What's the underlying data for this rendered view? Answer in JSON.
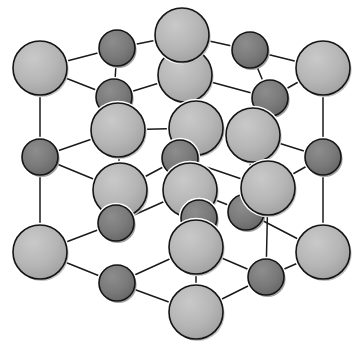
{
  "figure": {
    "background_color": "#ffffff",
    "width": 362,
    "height": 347
  },
  "style": {
    "large_sphere_fill": "#b4b4b4",
    "large_sphere_edge": "#141414",
    "large_sphere_highlight": "#c8c8c8",
    "large_sphere_shadow": "#8e8e8e",
    "small_sphere_fill": "#787878",
    "small_sphere_edge": "#141414",
    "small_sphere_highlight": "#8c8c8c",
    "small_sphere_shadow": "#555555",
    "bond_color": "#1a1a1a",
    "bond_width": 1.5,
    "large_radius": 27,
    "small_radius": 18
  },
  "chart_data": {
    "type": "scatter",
    "xlabel": "",
    "ylabel": "",
    "xlim": [
      0,
      362
    ],
    "ylim": [
      0,
      347
    ],
    "grid": false,
    "legend": null,
    "projection": "oblique",
    "lattice": {
      "type": "rock-salt",
      "grid_size": 3,
      "origin_screen": [
        40,
        252
      ],
      "axis_a_screen": [
        78,
        0
      ],
      "axis_b_screen": [
        0,
        -92
      ],
      "axis_c_screen": [
        52,
        -37
      ],
      "site_parity_rule": "sum of (i+j+k) even = large light sphere, odd = small dark sphere"
    },
    "series": [
      {
        "name": "large-anion",
        "label": "Large light-grey sphere (anion)",
        "color": "#b4b4b4",
        "radius": 27,
        "count": 14,
        "points": [
          {
            "id": "A01",
            "cx": 40,
            "cy": 68,
            "ijk": [
              0,
              2,
              0
            ],
            "z": 1
          },
          {
            "id": "A02",
            "cx": 182,
            "cy": 35,
            "ijk": [
              1,
              2,
              1
            ],
            "z": 3
          },
          {
            "id": "A03",
            "cx": 323,
            "cy": 68,
            "ijk": [
              2,
              2,
              0
            ],
            "z": 1
          },
          {
            "id": "A04",
            "cx": 185,
            "cy": 75,
            "ijk": [
              1,
              2,
              0
            ],
            "z": 2
          },
          {
            "id": "A05",
            "cx": 118,
            "cy": 130,
            "ijk": [
              1,
              1,
              2
            ],
            "z": 5
          },
          {
            "id": "A06",
            "cx": 196,
            "cy": 128,
            "ijk": [
              2,
              2,
              1
            ],
            "z": 6
          },
          {
            "id": "A07",
            "cx": 253,
            "cy": 135,
            "ijk": [
              2,
              1,
              1
            ],
            "z": 4
          },
          {
            "id": "A08",
            "cx": 120,
            "cy": 190,
            "ijk": [
              1,
              1,
              0
            ],
            "z": 7
          },
          {
            "id": "A09",
            "cx": 190,
            "cy": 190,
            "ijk": [
              2,
              1,
              0
            ],
            "z": 8
          },
          {
            "id": "A10",
            "cx": 268,
            "cy": 188,
            "ijk": [
              2,
              0,
              2
            ],
            "z": 9
          },
          {
            "id": "A11",
            "cx": 40,
            "cy": 252,
            "ijk": [
              0,
              0,
              0
            ],
            "z": 10
          },
          {
            "id": "A12",
            "cx": 196,
            "cy": 247,
            "ijk": [
              1,
              0,
              1
            ],
            "z": 11
          },
          {
            "id": "A13",
            "cx": 323,
            "cy": 252,
            "ijk": [
              2,
              0,
              0
            ],
            "z": 10
          },
          {
            "id": "A14",
            "cx": 196,
            "cy": 312,
            "ijk": [
              1,
              0,
              0
            ],
            "z": 12
          }
        ]
      },
      {
        "name": "small-cation",
        "label": "Small dark-grey sphere (cation)",
        "color": "#787878",
        "radius": 18,
        "count": 13,
        "points": [
          {
            "id": "B01",
            "cx": 117,
            "cy": 48,
            "ijk": [
              0,
              2,
              1
            ],
            "z": 2
          },
          {
            "id": "B02",
            "cx": 250,
            "cy": 50,
            "ijk": [
              2,
              2,
              1
            ],
            "z": 2
          },
          {
            "id": "B03",
            "cx": 114,
            "cy": 97,
            "ijk": [
              0,
              2,
              0
            ],
            "z": 3
          },
          {
            "id": "B04",
            "cx": 270,
            "cy": 98,
            "ijk": [
              2,
              2,
              0
            ],
            "z": 3
          },
          {
            "id": "B05",
            "cx": 40,
            "cy": 157,
            "ijk": [
              0,
              1,
              0
            ],
            "z": 4
          },
          {
            "id": "B06",
            "cx": 180,
            "cy": 158,
            "ijk": [
              1,
              1,
              1
            ],
            "z": 6
          },
          {
            "id": "B07",
            "cx": 323,
            "cy": 157,
            "ijk": [
              2,
              1,
              0
            ],
            "z": 4
          },
          {
            "id": "B08",
            "cx": 116,
            "cy": 223,
            "ijk": [
              1,
              0,
              2
            ],
            "z": 7
          },
          {
            "id": "B09",
            "cx": 199,
            "cy": 218,
            "ijk": [
              1,
              1,
              0
            ],
            "z": 9
          },
          {
            "id": "B10",
            "cx": 246,
            "cy": 212,
            "ijk": [
              2,
              1,
              0
            ],
            "z": 8
          },
          {
            "id": "B11",
            "cx": 117,
            "cy": 283,
            "ijk": [
              0,
              0,
              1
            ],
            "z": 11
          },
          {
            "id": "B12",
            "cx": 266,
            "cy": 277,
            "ijk": [
              2,
              0,
              1
            ],
            "z": 11
          },
          {
            "id": "B13",
            "cx": 199,
            "cy": 218,
            "ijk": [
              1,
              0,
              1
            ],
            "z": 9
          }
        ]
      }
    ],
    "bonds": [
      {
        "from": [
          40,
          68
        ],
        "to": [
          117,
          48
        ],
        "kind": "edge"
      },
      {
        "from": [
          117,
          48
        ],
        "to": [
          182,
          35
        ],
        "kind": "edge"
      },
      {
        "from": [
          182,
          35
        ],
        "to": [
          250,
          50
        ],
        "kind": "edge"
      },
      {
        "from": [
          250,
          50
        ],
        "to": [
          323,
          68
        ],
        "kind": "edge"
      },
      {
        "from": [
          40,
          68
        ],
        "to": [
          114,
          97
        ],
        "kind": "depth"
      },
      {
        "from": [
          114,
          97
        ],
        "to": [
          185,
          75
        ],
        "kind": "edge"
      },
      {
        "from": [
          185,
          75
        ],
        "to": [
          270,
          98
        ],
        "kind": "edge"
      },
      {
        "from": [
          270,
          98
        ],
        "to": [
          323,
          68
        ],
        "kind": "depth"
      },
      {
        "from": [
          117,
          48
        ],
        "to": [
          114,
          97
        ],
        "kind": "vertical"
      },
      {
        "from": [
          250,
          50
        ],
        "to": [
          270,
          98
        ],
        "kind": "vertical"
      },
      {
        "from": [
          182,
          35
        ],
        "to": [
          185,
          75
        ],
        "kind": "vertical"
      },
      {
        "from": [
          114,
          97
        ],
        "to": [
          118,
          130
        ],
        "kind": "vertical"
      },
      {
        "from": [
          270,
          98
        ],
        "to": [
          253,
          135
        ],
        "kind": "vertical"
      },
      {
        "from": [
          40,
          68
        ],
        "to": [
          40,
          157
        ],
        "kind": "vertical"
      },
      {
        "from": [
          323,
          68
        ],
        "to": [
          323,
          157
        ],
        "kind": "vertical"
      },
      {
        "from": [
          40,
          157
        ],
        "to": [
          118,
          130
        ],
        "kind": "edge"
      },
      {
        "from": [
          118,
          130
        ],
        "to": [
          196,
          128
        ],
        "kind": "edge"
      },
      {
        "from": [
          196,
          128
        ],
        "to": [
          253,
          135
        ],
        "kind": "edge"
      },
      {
        "from": [
          253,
          135
        ],
        "to": [
          323,
          157
        ],
        "kind": "edge"
      },
      {
        "from": [
          40,
          157
        ],
        "to": [
          120,
          190
        ],
        "kind": "depth"
      },
      {
        "from": [
          120,
          190
        ],
        "to": [
          180,
          158
        ],
        "kind": "edge"
      },
      {
        "from": [
          180,
          158
        ],
        "to": [
          268,
          188
        ],
        "kind": "edge"
      },
      {
        "from": [
          268,
          188
        ],
        "to": [
          323,
          157
        ],
        "kind": "depth"
      },
      {
        "from": [
          118,
          130
        ],
        "to": [
          120,
          190
        ],
        "kind": "vertical"
      },
      {
        "from": [
          196,
          128
        ],
        "to": [
          199,
          218
        ],
        "kind": "vertical"
      },
      {
        "from": [
          253,
          135
        ],
        "to": [
          246,
          212
        ],
        "kind": "vertical"
      },
      {
        "from": [
          120,
          190
        ],
        "to": [
          116,
          223
        ],
        "kind": "vertical"
      },
      {
        "from": [
          268,
          188
        ],
        "to": [
          266,
          277
        ],
        "kind": "vertical"
      },
      {
        "from": [
          40,
          157
        ],
        "to": [
          40,
          252
        ],
        "kind": "vertical"
      },
      {
        "from": [
          323,
          157
        ],
        "to": [
          323,
          252
        ],
        "kind": "vertical"
      },
      {
        "from": [
          40,
          252
        ],
        "to": [
          116,
          223
        ],
        "kind": "depth"
      },
      {
        "from": [
          116,
          223
        ],
        "to": [
          190,
          190
        ],
        "kind": "depth"
      },
      {
        "from": [
          190,
          190
        ],
        "to": [
          246,
          212
        ],
        "kind": "depth"
      },
      {
        "from": [
          246,
          212
        ],
        "to": [
          323,
          252
        ],
        "kind": "depth"
      },
      {
        "from": [
          40,
          252
        ],
        "to": [
          117,
          283
        ],
        "kind": "edge"
      },
      {
        "from": [
          117,
          283
        ],
        "to": [
          196,
          247
        ],
        "kind": "edge"
      },
      {
        "from": [
          196,
          247
        ],
        "to": [
          266,
          277
        ],
        "kind": "edge"
      },
      {
        "from": [
          266,
          277
        ],
        "to": [
          323,
          252
        ],
        "kind": "edge"
      },
      {
        "from": [
          117,
          283
        ],
        "to": [
          196,
          312
        ],
        "kind": "edge"
      },
      {
        "from": [
          196,
          312
        ],
        "to": [
          266,
          277
        ],
        "kind": "edge"
      },
      {
        "from": [
          196,
          247
        ],
        "to": [
          196,
          312
        ],
        "kind": "vertical"
      },
      {
        "from": [
          199,
          218
        ],
        "to": [
          196,
          247
        ],
        "kind": "vertical"
      },
      {
        "from": [
          180,
          158
        ],
        "to": [
          199,
          218
        ],
        "kind": "vertical"
      },
      {
        "from": [
          190,
          190
        ],
        "to": [
          196,
          247
        ],
        "kind": "vertical"
      }
    ]
  }
}
